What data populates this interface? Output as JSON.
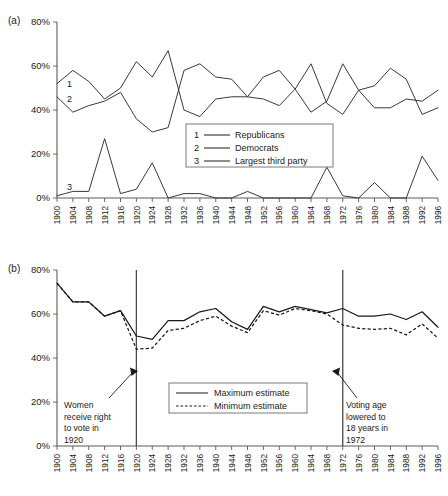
{
  "figure": {
    "panel_a_tag": "(a)",
    "panel_b_tag": "(b)"
  },
  "chart_data": [
    {
      "id": "panel_a",
      "type": "line",
      "title": "",
      "xlabel": "",
      "ylabel": "",
      "ylim": [
        0,
        80
      ],
      "yticks": [
        0,
        20,
        40,
        60,
        80
      ],
      "ytick_labels": [
        "0%",
        "20%",
        "40%",
        "60%",
        "80%"
      ],
      "grid": false,
      "legend_position": "center",
      "x": [
        1900,
        1904,
        1908,
        1912,
        1916,
        1920,
        1924,
        1928,
        1932,
        1936,
        1940,
        1944,
        1948,
        1952,
        1956,
        1960,
        1964,
        1968,
        1972,
        1976,
        1980,
        1984,
        1988,
        1992,
        1996
      ],
      "xtick_labels": [
        "1900",
        "1904",
        "1908",
        "1912",
        "1916",
        "1920",
        "1924",
        "1928",
        "1932",
        "1936",
        "1940",
        "1944",
        "1948",
        "1952",
        "1956",
        "1960",
        "1964",
        "1968",
        "1972",
        "1976",
        "1980",
        "1984",
        "1988",
        "1992",
        "1996"
      ],
      "series": [
        {
          "key": "1",
          "name": "Republicans",
          "style": "solid",
          "values": [
            52,
            58,
            53,
            45,
            50,
            62,
            55,
            67,
            40,
            37,
            45,
            46,
            46,
            55,
            58,
            49.5,
            39,
            44,
            61,
            49,
            51,
            59,
            54,
            38,
            41
          ]
        },
        {
          "key": "2",
          "name": "Democrats",
          "style": "solid",
          "values": [
            46,
            39,
            42,
            44,
            48,
            36,
            30,
            32,
            58,
            61,
            55,
            54,
            46,
            45,
            42,
            49.5,
            61,
            43,
            38,
            49,
            41,
            41,
            45,
            44,
            49
          ]
        },
        {
          "key": "3",
          "name": "Largest third party",
          "style": "solid",
          "values": [
            1,
            3,
            3,
            27,
            2,
            4,
            16,
            0,
            2,
            2,
            0,
            0,
            3,
            0,
            0,
            0,
            0,
            14,
            1,
            0,
            7,
            0,
            0,
            19,
            8
          ]
        }
      ],
      "inline_labels": [
        {
          "key": "1",
          "x": 1902,
          "y": 52
        },
        {
          "key": "2",
          "x": 1902,
          "y": 45
        },
        {
          "key": "3",
          "x": 1902,
          "y": 5
        }
      ],
      "legend": [
        {
          "key": "1",
          "label": "Republicans"
        },
        {
          "key": "2",
          "label": "Democrats"
        },
        {
          "key": "3",
          "label": "Largest third party"
        }
      ]
    },
    {
      "id": "panel_b",
      "type": "line",
      "title": "",
      "xlabel": "",
      "ylabel": "",
      "ylim": [
        0,
        80
      ],
      "yticks": [
        0,
        20,
        40,
        60,
        80
      ],
      "ytick_labels": [
        "0%",
        "20%",
        "40%",
        "60%",
        "80%"
      ],
      "grid": false,
      "legend_position": "center",
      "x": [
        1900,
        1904,
        1908,
        1912,
        1916,
        1920,
        1924,
        1928,
        1932,
        1936,
        1940,
        1944,
        1948,
        1952,
        1956,
        1960,
        1964,
        1968,
        1972,
        1976,
        1980,
        1984,
        1988,
        1992,
        1996
      ],
      "xtick_labels": [
        "1900",
        "1904",
        "1908",
        "1912",
        "1916",
        "1920",
        "1924",
        "1928",
        "1932",
        "1936",
        "1940",
        "1944",
        "1948",
        "1952",
        "1956",
        "1960",
        "1964",
        "1968",
        "1972",
        "1976",
        "1980",
        "1984",
        "1988",
        "1992",
        "1996"
      ],
      "series": [
        {
          "key": "max",
          "name": "Maximum estimate",
          "style": "solid",
          "values": [
            74,
            65.5,
            65.5,
            59,
            61.5,
            50,
            48.5,
            57,
            57,
            61,
            62.5,
            56.5,
            53,
            63.5,
            61,
            63.5,
            62,
            60.5,
            62.5,
            59,
            59,
            60,
            57.5,
            61,
            54
          ]
        },
        {
          "key": "min",
          "name": "Minimum estimate",
          "style": "dashed",
          "values": [
            74,
            65.5,
            65.5,
            59,
            61.5,
            44,
            44.5,
            52.5,
            53.5,
            57,
            59,
            54.5,
            51.5,
            61.5,
            59.5,
            62.5,
            61.5,
            60,
            55,
            53.5,
            53,
            53.5,
            50.5,
            55.5,
            49
          ]
        }
      ],
      "legend": [
        {
          "key": "max",
          "label": "Maximum estimate"
        },
        {
          "key": "min",
          "label": "Minimum estimate"
        }
      ],
      "reference_lines": [
        {
          "x": 1920,
          "id": "suffrage"
        },
        {
          "x": 1972,
          "id": "voting-age"
        }
      ],
      "annotations": [
        {
          "id": "suffrage",
          "lines": [
            "Women",
            "receive right",
            "to vote in",
            "1920"
          ],
          "points_to": 1920
        },
        {
          "id": "voting-age",
          "lines": [
            "Voting age",
            "lowered to",
            "18 years in",
            "1972"
          ],
          "points_to": 1972
        }
      ]
    }
  ]
}
